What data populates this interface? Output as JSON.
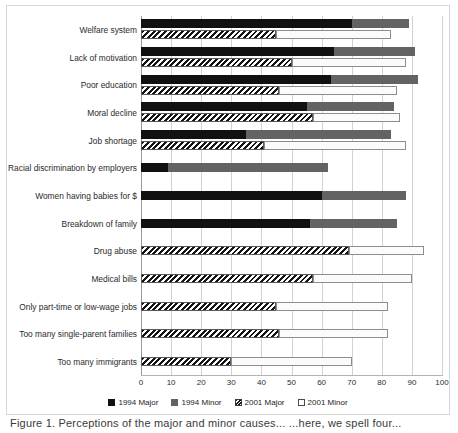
{
  "chart_data": {
    "type": "bar",
    "orientation": "horizontal",
    "stacked": true,
    "title": "",
    "xlabel": "",
    "ylabel": "",
    "xlim": [
      0,
      100
    ],
    "xticks": [
      0,
      10,
      20,
      30,
      40,
      50,
      60,
      70,
      80,
      90,
      100
    ],
    "grid": true,
    "legend_position": "bottom",
    "legend": [
      "1994 Major",
      "1994 Minor",
      "2001 Major",
      "2001 Minor"
    ],
    "colors": {
      "1994 Major": "#111111",
      "1994 Minor": "#636363",
      "2001 Major": "#ffffff",
      "2001 Minor": "#ffffff"
    },
    "categories": [
      "Welfare system",
      "Lack of motivation",
      "Poor education",
      "Moral decline",
      "Job shortage",
      "Racial discrimination by employers",
      "Women having babies for $",
      "Breakdown of family",
      "Drug abuse",
      "Medical bills",
      "Only part-time or low-wage jobs",
      "Too many single-parent families",
      "Too many immigrants"
    ],
    "series": [
      {
        "name": "1994 Major",
        "values": [
          70,
          64,
          63,
          55,
          35,
          9,
          60,
          56,
          null,
          null,
          null,
          null,
          null
        ]
      },
      {
        "name": "1994 Minor",
        "values": [
          19,
          27,
          29,
          29,
          48,
          53,
          28,
          29,
          null,
          null,
          null,
          null,
          null
        ]
      },
      {
        "name": "2001 Major",
        "values": [
          45,
          50,
          46,
          57,
          41,
          null,
          null,
          null,
          69,
          57,
          45,
          46,
          30
        ]
      },
      {
        "name": "2001 Minor",
        "values": [
          38,
          38,
          39,
          29,
          47,
          null,
          null,
          null,
          25,
          33,
          37,
          36,
          40
        ]
      }
    ],
    "totals_1994": [
      89,
      91,
      92,
      84,
      83,
      62,
      88,
      85,
      null,
      null,
      null,
      null,
      null
    ],
    "totals_2001": [
      83,
      88,
      85,
      86,
      88,
      null,
      null,
      null,
      94,
      90,
      82,
      82,
      70
    ]
  },
  "legend": {
    "items": [
      {
        "label": "1994 Major",
        "swatch": "legend-swatch-1994-major"
      },
      {
        "label": "1994 Minor",
        "swatch": "legend-swatch-1994-minor"
      },
      {
        "label": "2001 Major",
        "swatch": "legend-swatch-2001-major"
      },
      {
        "label": "2001 Minor",
        "swatch": "legend-swatch-2001-minor"
      }
    ]
  },
  "caption": "Figure 1.  Perceptions of the major and minor causes... ...here, we spell four..."
}
